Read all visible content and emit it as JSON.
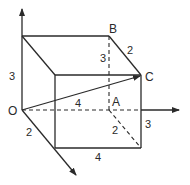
{
  "diagram": {
    "type": "3D cuboid with vector OC",
    "points": {
      "O": "O",
      "A": "A",
      "B": "B",
      "C": "C"
    },
    "dimensions": {
      "left_height": "3",
      "dashed_height_AB": "3",
      "right_height": "3",
      "depth_top_BC": "2",
      "depth_O": "2",
      "depth_A": "2",
      "width_OA": "4",
      "width_bottom": "4"
    },
    "colors": {
      "line": "#2a2a2a",
      "background": "#ffffff"
    }
  }
}
